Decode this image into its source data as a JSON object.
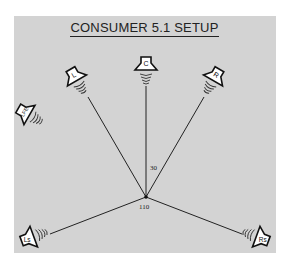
{
  "title": "CONSUMER 5.1 SETUP",
  "colors": {
    "background": "#d3d3d3",
    "line": "#222222",
    "speaker_fill": "#ffffff",
    "speaker_stroke": "#111111"
  },
  "listener": {
    "x": 146,
    "y": 197
  },
  "speakers": [
    {
      "id": "L",
      "label": "L",
      "x": 75,
      "y": 77,
      "rotate": -30
    },
    {
      "id": "C",
      "label": "C",
      "x": 146,
      "y": 66,
      "rotate": 0
    },
    {
      "id": "R",
      "label": "R",
      "x": 215,
      "y": 77,
      "rotate": 30
    },
    {
      "id": "LFE",
      "label": "LFE",
      "x": 26,
      "y": 113,
      "rotate": -60
    },
    {
      "id": "Ls",
      "label": "Ls",
      "x": 30,
      "y": 238,
      "rotate": -110
    },
    {
      "id": "Rs",
      "label": "Rs",
      "x": 260,
      "y": 238,
      "rotate": 110
    }
  ],
  "angles": [
    {
      "label": "30",
      "x": 150,
      "y": 164
    },
    {
      "label": "110",
      "x": 139,
      "y": 203
    }
  ]
}
